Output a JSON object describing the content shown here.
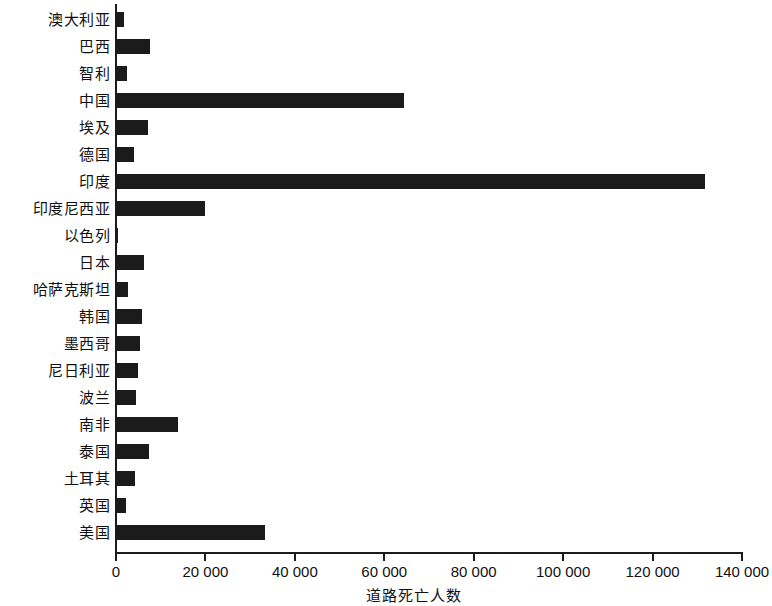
{
  "chart_data": {
    "type": "bar",
    "orientation": "horizontal",
    "title": "",
    "xlabel": "道路死亡人数",
    "ylabel": "",
    "xlim": [
      0,
      140000
    ],
    "grid": false,
    "legend": false,
    "tick_labels": [
      "0",
      "20 000",
      "40 000",
      "60 000",
      "80 000",
      "100 000",
      "120 000",
      "140 000"
    ],
    "tick_values": [
      0,
      20000,
      40000,
      60000,
      80000,
      100000,
      120000,
      140000
    ],
    "bar_color": "#1b1b1b",
    "categories": [
      "澳大利亚",
      "巴西",
      "智利",
      "中国",
      "埃及",
      "德国",
      "印度",
      "印度尼西亚",
      "以色列",
      "日本",
      "哈萨克斯坦",
      "韩国",
      "墨西哥",
      "尼日利亚",
      "波兰",
      "南非",
      "泰国",
      "土耳其",
      "英国",
      "美国"
    ],
    "values": [
      1800,
      7600,
      2500,
      64400,
      7100,
      4000,
      131700,
      19900,
      500,
      6300,
      2700,
      5800,
      5400,
      4900,
      4500,
      13900,
      7400,
      4300,
      2200,
      33400
    ]
  }
}
